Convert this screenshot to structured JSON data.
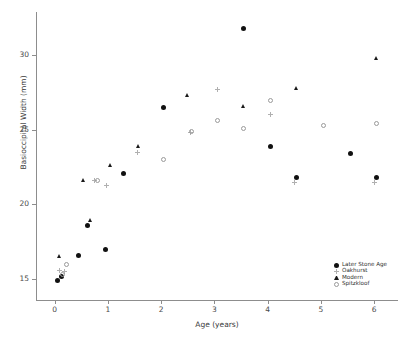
{
  "chart_data": {
    "type": "scatter",
    "title": "",
    "xlabel": "Age (years)",
    "ylabel": "Basioccipital Width (mm)",
    "xlim": [
      -0.35,
      6.45
    ],
    "ylim": [
      13.6,
      32.9
    ],
    "xticks": [
      0,
      1,
      2,
      3,
      4,
      5,
      6
    ],
    "yticks": [
      15,
      20,
      25,
      30
    ],
    "xtick_labels": [
      "0",
      "1",
      "2",
      "3",
      "4",
      "5",
      "6"
    ],
    "ytick_labels": [
      "15",
      "20",
      "25",
      "30"
    ],
    "grid": false,
    "legend_position": "bottom-right",
    "series": [
      {
        "name": "Later Stone Age",
        "marker": "filled-circle",
        "color": "#111111",
        "points": [
          [
            0.05,
            14.9
          ],
          [
            0.12,
            15.2
          ],
          [
            0.45,
            16.6
          ],
          [
            0.62,
            18.6
          ],
          [
            0.95,
            17.0
          ],
          [
            1.3,
            22.1
          ],
          [
            2.05,
            26.5
          ],
          [
            3.55,
            31.8
          ],
          [
            4.05,
            23.9
          ],
          [
            4.55,
            21.8
          ],
          [
            5.55,
            23.4
          ],
          [
            6.05,
            21.8
          ]
        ]
      },
      {
        "name": "Oakhurst",
        "marker": "plus",
        "color": "#b0b0b0",
        "points": [
          [
            0.1,
            15.6
          ],
          [
            0.18,
            15.5
          ],
          [
            0.75,
            21.6
          ],
          [
            0.98,
            21.3
          ],
          [
            1.55,
            23.5
          ],
          [
            2.55,
            24.8
          ],
          [
            3.05,
            27.7
          ],
          [
            4.05,
            26.0
          ],
          [
            4.5,
            21.5
          ],
          [
            6.0,
            21.5
          ]
        ]
      },
      {
        "name": "Modern",
        "marker": "filled-triangle",
        "color": "#1a1a1a",
        "points": [
          [
            0.1,
            16.5
          ],
          [
            0.55,
            21.6
          ],
          [
            0.68,
            18.9
          ],
          [
            1.05,
            22.6
          ],
          [
            1.58,
            23.9
          ],
          [
            2.5,
            27.3
          ],
          [
            3.55,
            26.6
          ],
          [
            4.55,
            27.8
          ],
          [
            6.05,
            29.8
          ]
        ]
      },
      {
        "name": "Spitzkloof",
        "marker": "open-circle",
        "color": "#9a9a9a",
        "points": [
          [
            0.15,
            15.3
          ],
          [
            0.22,
            16.0
          ],
          [
            0.8,
            21.6
          ],
          [
            2.05,
            23.0
          ],
          [
            2.58,
            24.9
          ],
          [
            3.05,
            25.6
          ],
          [
            3.55,
            25.1
          ],
          [
            4.05,
            27.0
          ],
          [
            5.05,
            25.3
          ],
          [
            6.05,
            25.4
          ]
        ]
      }
    ]
  },
  "legend": {
    "items": [
      {
        "label": "Later Stone Age",
        "marker": "filled-circle"
      },
      {
        "label": "Oakhurst",
        "marker": "plus"
      },
      {
        "label": "Modern",
        "marker": "filled-triangle"
      },
      {
        "label": "Spitzkloof",
        "marker": "open-circle"
      }
    ]
  }
}
